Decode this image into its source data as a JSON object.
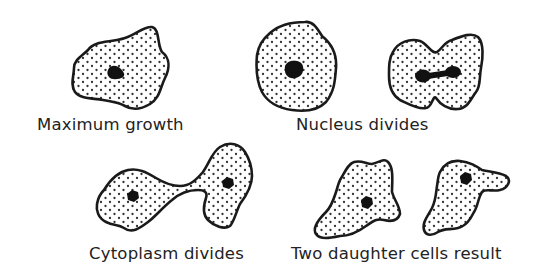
{
  "diagram": {
    "type": "biology-illustration",
    "colors": {
      "outline": "#1a1a1a",
      "nucleus": "#111111",
      "stipple": "#333333",
      "background": "#ffffff",
      "text": "#222222"
    },
    "stages": [
      {
        "id": "maximum-growth",
        "label": "Maximum growth",
        "cells": 1
      },
      {
        "id": "nucleus-divides",
        "label": "Nucleus divides",
        "cells": 2
      },
      {
        "id": "cytoplasm-divides",
        "label": "Cytoplasm divides",
        "cells": 1
      },
      {
        "id": "two-daughter-cells",
        "label": "Two daughter cells result",
        "cells": 2
      }
    ]
  }
}
